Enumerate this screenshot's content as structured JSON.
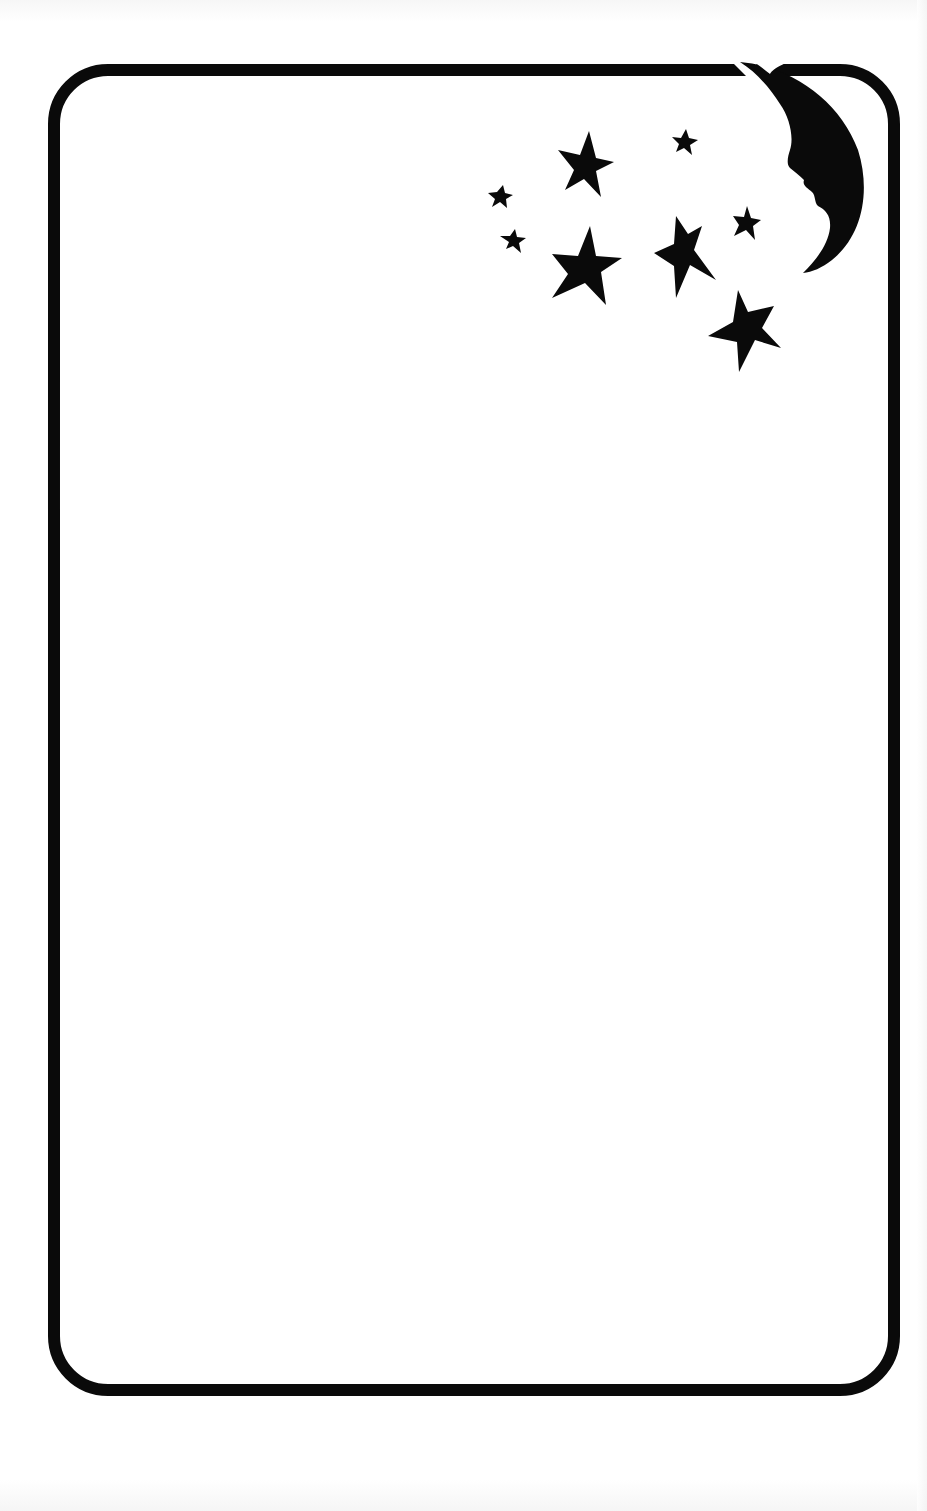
{
  "card": {
    "type": "blank stationery frame",
    "body_text": "",
    "colors": {
      "background": "#ffffff",
      "ink": "#0a0a0a"
    },
    "frame": {
      "shape": "rounded-rectangle",
      "x": 48,
      "y": 64,
      "width": 852,
      "height": 1332,
      "corner_radius": 58,
      "stroke_width": 12
    },
    "decoration": {
      "moon": {
        "kind": "crescent-moon-with-face-profile",
        "position": "top-right"
      },
      "stars": [
        {
          "cx": 586,
          "cy": 163,
          "r": 30
        },
        {
          "cx": 684,
          "cy": 142,
          "r": 13
        },
        {
          "cx": 500,
          "cy": 197,
          "r": 13
        },
        {
          "cx": 513,
          "cy": 241,
          "r": 14
        },
        {
          "cx": 586,
          "cy": 264,
          "r": 36
        },
        {
          "cx": 683,
          "cy": 255,
          "r": 33
        },
        {
          "cx": 746,
          "cy": 223,
          "r": 16
        },
        {
          "cx": 745,
          "cy": 330,
          "r": 37
        }
      ]
    }
  }
}
